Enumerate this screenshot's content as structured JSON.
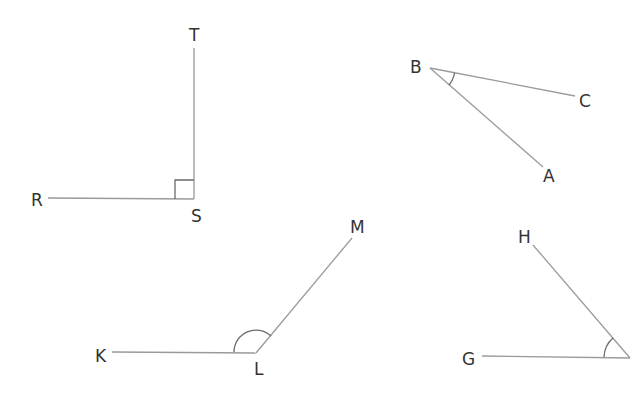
{
  "diagram": {
    "type": "geometry-angles",
    "colors": {
      "line": "#9a9a9a",
      "marker": "#6b6b6b",
      "label": "#333333",
      "background": "#ffffff"
    },
    "angles": [
      {
        "name": "RST",
        "vertex": "S",
        "arms": [
          "R",
          "T"
        ],
        "marker": "right-angle-square",
        "labels": {
          "R": "R",
          "S": "S",
          "T": "T"
        }
      },
      {
        "name": "ABC",
        "vertex": "B",
        "arms": [
          "C",
          "A"
        ],
        "marker": "arc",
        "labels": {
          "B": "B",
          "C": "C",
          "A": "A"
        }
      },
      {
        "name": "KLM",
        "vertex": "L",
        "arms": [
          "K",
          "M"
        ],
        "marker": "arc",
        "labels": {
          "K": "K",
          "L": "L",
          "M": "M"
        }
      },
      {
        "name": "GH",
        "vertex": "unlabeled",
        "arms": [
          "G",
          "H"
        ],
        "marker": "arc",
        "labels": {
          "G": "G",
          "H": "H"
        }
      }
    ]
  }
}
